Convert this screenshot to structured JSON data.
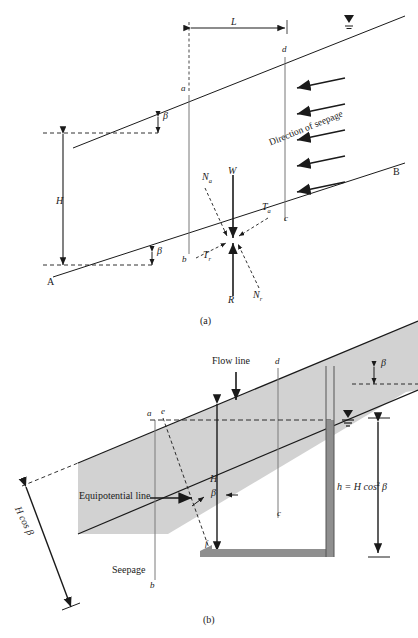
{
  "figure": {
    "domain": "engineering-diagram",
    "title_internal": "Infinite slope with steady-state seepage",
    "panels": [
      {
        "caption": "(a)",
        "name": "force-diagram",
        "labels": {
          "length_L": "L",
          "height_H": "H",
          "slope_angle_top": "β",
          "slope_angle_bottom": "β",
          "seepage_text": "Direction of seepage",
          "point_a": "a",
          "point_b": "b",
          "point_c": "c",
          "point_d": "d",
          "point_A": "A",
          "point_B": "B",
          "force_Na": "N",
          "force_Na_sub": "a",
          "force_W": "W",
          "force_Ta": "T",
          "force_Ta_sub": "a",
          "force_Tr": "T",
          "force_Tr_sub": "r",
          "force_R": "R",
          "force_Nr": "N",
          "force_Nr_sub": "r"
        },
        "seepage_arrow_count": 5
      },
      {
        "caption": "(b)",
        "name": "flow-net-diagram",
        "labels": {
          "flow_line": "Flow line",
          "equipotential_line": "Equipotential line",
          "seepage": "Seepage",
          "height_H": "H",
          "height_Hcos": "H cos β",
          "head_h": "h = H cos",
          "head_h_exp": "2",
          "head_h_beta": "β",
          "slope_angle_top": "β",
          "slope_angle_mid": "β",
          "point_a": "a",
          "point_b": "b",
          "point_c": "c",
          "point_d": "d",
          "point_e": "e",
          "point_f": "f"
        }
      }
    ]
  },
  "colors": {
    "line": "#1a1a1a",
    "soil_fill": "#d2d2d2",
    "tube_fill": "#8f8f8f",
    "background": "#ffffff"
  }
}
